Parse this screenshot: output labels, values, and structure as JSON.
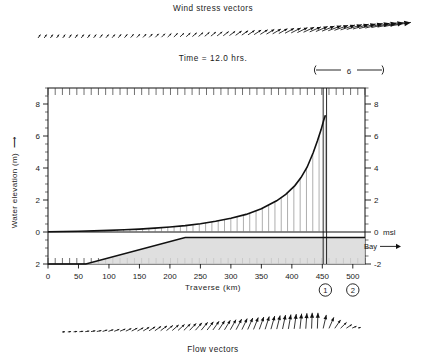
{
  "figure": {
    "wind_title": "Wind stress vectors",
    "flow_title": "Flow vectors",
    "time_label": "Time = 12.0 hrs.",
    "scalebar_value": "6",
    "bay_label": "Bay",
    "msl_label": "msl",
    "marker_1": "1",
    "marker_2": "2"
  },
  "axes": {
    "ylabel": "Water elevation (m)",
    "xlabel": "Traverse (km)",
    "x_ticks": [
      "0",
      "50",
      "100",
      "150",
      "200",
      "250",
      "300",
      "350",
      "400",
      "450",
      "500"
    ],
    "x_tick_values": [
      0,
      50,
      100,
      150,
      200,
      250,
      300,
      350,
      400,
      450,
      500
    ],
    "xlim": [
      0,
      520
    ],
    "y_left_ticks": [
      "8",
      "6",
      "4",
      "2",
      "0",
      "2"
    ],
    "y_left_tick_values": [
      8,
      6,
      4,
      2,
      0,
      -2
    ],
    "y_right_ticks": [
      "8",
      "6",
      "4",
      "2",
      "0",
      "-2"
    ],
    "y_right_tick_values": [
      8,
      6,
      4,
      2,
      0,
      -2
    ],
    "ylim": [
      -2,
      9
    ]
  },
  "chart_data": {
    "type": "line",
    "title": "Wind stress vectors",
    "subtitle": "Time = 12.0 hrs.",
    "xlabel": "Traverse (km)",
    "ylabel": "Water elevation (m)",
    "xlim": [
      0,
      520
    ],
    "ylim": [
      -2,
      9
    ],
    "grid": false,
    "legend": "none",
    "series": [
      {
        "name": "Water elevation",
        "x": [
          0,
          25,
          50,
          75,
          100,
          125,
          150,
          175,
          200,
          225,
          250,
          275,
          300,
          325,
          350,
          375,
          390,
          405,
          415,
          425,
          435,
          442,
          448,
          452,
          455
        ],
        "y": [
          0.02,
          0.03,
          0.05,
          0.07,
          0.1,
          0.14,
          0.18,
          0.24,
          0.31,
          0.4,
          0.52,
          0.67,
          0.86,
          1.1,
          1.45,
          1.95,
          2.35,
          2.9,
          3.4,
          4.05,
          4.95,
          5.7,
          6.4,
          6.95,
          7.3
        ]
      },
      {
        "name": "Bottom bathymetry",
        "x": [
          0,
          62,
          225,
          455,
          520
        ],
        "y": [
          -2.0,
          -2.0,
          -0.35,
          -0.35,
          -0.35
        ]
      }
    ],
    "markers": [
      {
        "label": "1",
        "x": 455
      },
      {
        "label": "2",
        "x": 500
      }
    ],
    "annotations": [
      {
        "text": "msl",
        "y": 0
      },
      {
        "text": "Bay",
        "x": 485,
        "y": -0.9
      },
      {
        "text": "6",
        "note": "vector magnitude scale bar"
      }
    ]
  },
  "wind_vectors": {
    "count": 58,
    "description": "arrows increasing in length toward the right, rotating from steep to near-horizontal"
  },
  "flow_vectors": {
    "count": 52,
    "description": "arrows rotating from near-horizontal at left to vertical at right, shrinking at far right"
  }
}
